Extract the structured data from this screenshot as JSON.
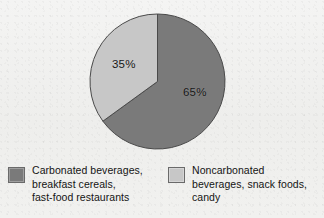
{
  "chart_data": {
    "type": "pie",
    "title": "",
    "subtitle": "",
    "categories": [
      "Carbonated beverages, breakfast cereals, fast-food restaurants",
      "Noncarbonated beverages, snack foods, candy"
    ],
    "values": [
      65,
      35
    ],
    "value_labels": [
      "65%",
      "35%"
    ],
    "units": "percent",
    "colors": [
      "#7a7a7a",
      "#c7c7c7"
    ],
    "start_angle_deg": 0,
    "direction": "clockwise",
    "legend_position": "bottom",
    "grid": false,
    "xlabel": "",
    "ylabel": ""
  },
  "pie": {
    "slices": [
      {
        "name": "carbonated",
        "label": "65%",
        "value": 65,
        "color": "#7a7a7a",
        "edge_color": "#4a4a4a"
      },
      {
        "name": "noncarbonated",
        "label": "35%",
        "value": 35,
        "color": "#c7c7c7",
        "edge_color": "#4a4a4a"
      }
    ]
  },
  "legend": {
    "entries": [
      {
        "swatch_color": "#7a7a7a",
        "swatch_name": "legend-swatch-carbonated",
        "lines": [
          "Carbonated beverages,",
          "breakfast cereals,",
          "fast-food restaurants"
        ]
      },
      {
        "swatch_color": "#c7c7c7",
        "swatch_name": "legend-swatch-noncarbonated",
        "lines": [
          "Noncarbonated",
          "beverages, snack foods,",
          "candy"
        ]
      }
    ]
  },
  "figure": {
    "background_color": "#f1f1ef",
    "text_color": "#141414"
  }
}
